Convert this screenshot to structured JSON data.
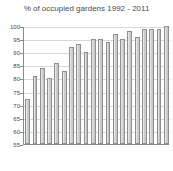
{
  "chart_data": {
    "type": "bar",
    "title": "% of occupied gardens 1992 - 2011",
    "xlabel": "",
    "ylabel": "",
    "ylim": [
      55,
      100
    ],
    "grid": true,
    "legend": "none",
    "categories": [
      "1992",
      "1993",
      "1994",
      "1995",
      "1996",
      "1997",
      "1998",
      "1999",
      "2000",
      "2001",
      "2002",
      "2003",
      "2004",
      "2005",
      "2006",
      "2007",
      "2008",
      "2009",
      "2010",
      "2011"
    ],
    "values": [
      72,
      81,
      84,
      80,
      86,
      83,
      92,
      93,
      90,
      95,
      95,
      94,
      97,
      95,
      98,
      96,
      99,
      99,
      99,
      100
    ],
    "y_ticks": [
      100,
      95,
      90,
      85,
      80,
      75,
      70,
      65,
      60,
      55
    ],
    "y_tick_labels": [
      "100",
      "95",
      "90",
      "85",
      "80",
      "75",
      "70",
      "65",
      "60",
      "55"
    ],
    "series": [
      {
        "name": "% of occupied gardens",
        "values": [
          72,
          81,
          84,
          80,
          86,
          83,
          92,
          93,
          90,
          95,
          95,
          94,
          97,
          95,
          98,
          96,
          99,
          99,
          99,
          100
        ]
      }
    ]
  },
  "colors": {
    "bar_fill": "#d2d2d2",
    "bar_stroke": "#909090",
    "grid": "#d8d8d8",
    "axis": "#8a8a8a",
    "text": "#4a4a4a",
    "background": "#ffffff"
  }
}
